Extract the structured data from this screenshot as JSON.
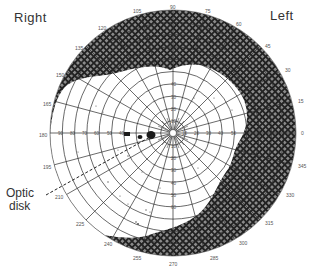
{
  "diagram": {
    "type": "visual-field-perimetry-chart",
    "eye_labels": {
      "right": "Right",
      "left": "Left"
    },
    "annotation": {
      "line1": "Optic",
      "line2": "disk"
    },
    "angle_labels": [
      "0",
      "15",
      "30",
      "45",
      "60",
      "75",
      "90",
      "105",
      "120",
      "135",
      "150",
      "165",
      "180",
      "195",
      "210",
      "225",
      "240",
      "255",
      "270",
      "285",
      "300",
      "315",
      "330",
      "345"
    ],
    "radial_labels": [
      "10",
      "20",
      "30",
      "40",
      "50",
      "60",
      "70",
      "80",
      "90"
    ],
    "colors": {
      "grid": "#2a2a2a",
      "hatch_dark": "#222222",
      "hatch_light": "#8a8a8a",
      "background": "#ffffff",
      "text": "#333333"
    },
    "regions": {
      "shaded": "scotoma / visual field loss (outer periphery)",
      "clear": "preserved visual field",
      "blind_spot": "optic disk"
    }
  }
}
